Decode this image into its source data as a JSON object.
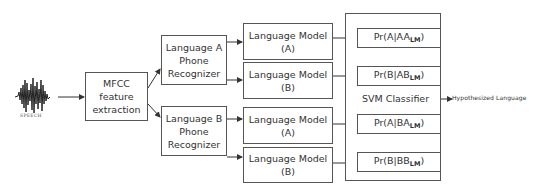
{
  "diagram": {
    "input": {
      "icon": "speech-waveform-icon",
      "label": "SPEECH"
    },
    "feature_extraction": {
      "lines": [
        "MFCC",
        "feature",
        "extraction"
      ]
    },
    "phone_recognizers": [
      {
        "lines": [
          "Language A",
          "Phone",
          "Recognizer"
        ]
      },
      {
        "lines": [
          "Language B",
          "Phone",
          "Recognizer"
        ]
      }
    ],
    "language_models": [
      {
        "lines": [
          "Language Model",
          "(A)"
        ]
      },
      {
        "lines": [
          "Language Model",
          "(B)"
        ]
      },
      {
        "lines": [
          "Language Model",
          "(A)"
        ]
      },
      {
        "lines": [
          "Language Model",
          "(B)"
        ]
      }
    ],
    "svm": {
      "label": "SVM Classifier",
      "scores": [
        {
          "prefix": "Pr(A|AA",
          "sub": "LM",
          "suffix": ")"
        },
        {
          "prefix": "Pr(B|AB",
          "sub": "LM",
          "suffix": ")"
        },
        {
          "prefix": "Pr(A|BA",
          "sub": "LM",
          "suffix": ")"
        },
        {
          "prefix": "Pr(B|BB",
          "sub": "LM",
          "suffix": ")"
        }
      ]
    },
    "output": {
      "label": "Hypothesized  Language"
    },
    "colors": {
      "line": "#333333",
      "box_border": "#555555",
      "text": "#333333"
    }
  }
}
